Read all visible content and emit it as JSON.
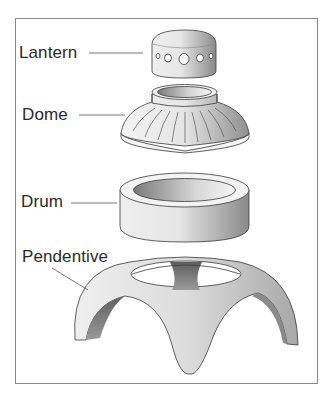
{
  "diagram": {
    "type": "exploded-view",
    "labels": [
      {
        "id": "lantern",
        "text": "Lantern"
      },
      {
        "id": "dome",
        "text": "Dome"
      },
      {
        "id": "drum",
        "text": "Drum"
      },
      {
        "id": "pendentive",
        "text": "Pendentive"
      }
    ],
    "colors": {
      "stroke": "#3a3a3a",
      "light": "#f2f2f2",
      "mid": "#c8c8c8",
      "dark": "#6e6e6e",
      "frame": "#8a8a8a"
    }
  }
}
